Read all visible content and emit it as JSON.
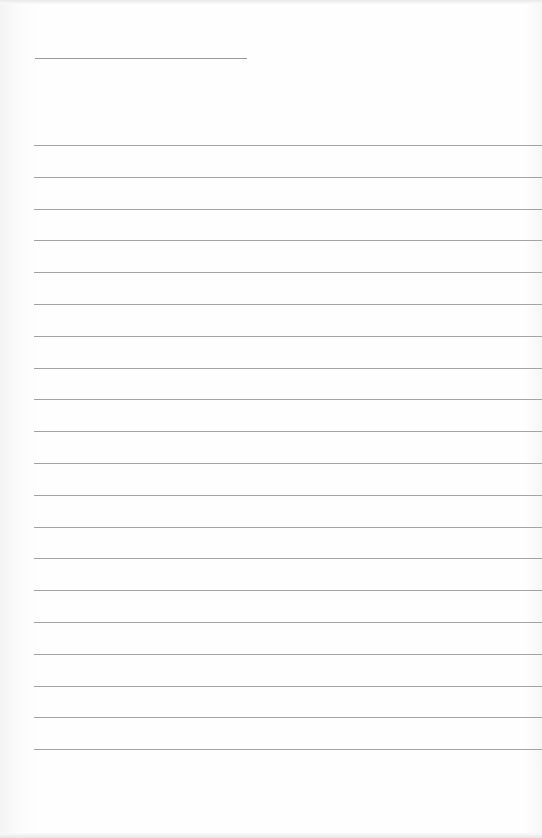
{
  "page": {
    "type": "blank-lined-paper",
    "background_color": "#fdfdfd",
    "line_color": "#a3a3a3",
    "title_line": {
      "text": ""
    },
    "ruled_lines": [
      {
        "text": ""
      },
      {
        "text": ""
      },
      {
        "text": ""
      },
      {
        "text": ""
      },
      {
        "text": ""
      },
      {
        "text": ""
      },
      {
        "text": ""
      },
      {
        "text": ""
      },
      {
        "text": ""
      },
      {
        "text": ""
      },
      {
        "text": ""
      },
      {
        "text": ""
      },
      {
        "text": ""
      },
      {
        "text": ""
      },
      {
        "text": ""
      },
      {
        "text": ""
      },
      {
        "text": ""
      },
      {
        "text": ""
      },
      {
        "text": ""
      },
      {
        "text": ""
      }
    ]
  }
}
